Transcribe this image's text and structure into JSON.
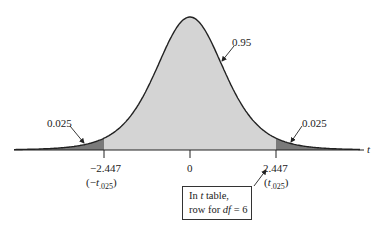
{
  "figure": {
    "type": "t-distribution",
    "degrees_of_freedom": 6,
    "center_area_label": "0.95",
    "left_tail_label": "0.025",
    "right_tail_label": "0.025",
    "axis_label": "t",
    "ticks": {
      "left": {
        "value": "−2.447",
        "sub_prefix": "(−",
        "sub_t": "t",
        "sub_index": ".025",
        "sub_suffix": ")"
      },
      "center": {
        "value": "0"
      },
      "right": {
        "value": "2.447",
        "sub_prefix": "(",
        "sub_t": "t",
        "sub_index": ".025",
        "sub_suffix": ")"
      }
    },
    "callout": {
      "line1_prefix": "In ",
      "line1_t": "t",
      "line1_suffix": " table,",
      "line2_prefix": "row for ",
      "line2_df": "df",
      "line2_suffix": " = 6"
    },
    "colors": {
      "center_fill": "#d4d4d4",
      "tail_fill": "#7a7a7a",
      "curve": "#222222"
    }
  }
}
